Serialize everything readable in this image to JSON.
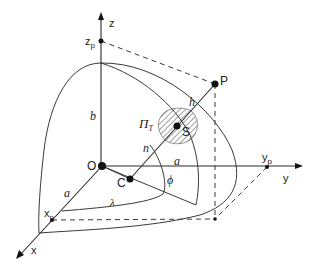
{
  "diagram": {
    "labels": {
      "z_axis": "z",
      "z_p": "z",
      "z_p_sub": "p",
      "x_axis": "x",
      "x_p": "x",
      "x_p_sub": "p",
      "y_axis": "y",
      "y_p": "y",
      "y_p_sub": "p",
      "origin": "O",
      "center_C": "C",
      "point_P": "P",
      "point_S": "S",
      "plane": "Π",
      "plane_sub": "T",
      "semi_minor_b": "b",
      "semi_major_a_x": "a",
      "semi_major_a_y": "a",
      "normal_n": "n",
      "height_h": "h",
      "latitude_phi": "ϕ",
      "longitude_lambda": "λ"
    },
    "colors": {
      "line": "#3a3a3a",
      "point": "#111111",
      "background": "#ffffff"
    }
  }
}
